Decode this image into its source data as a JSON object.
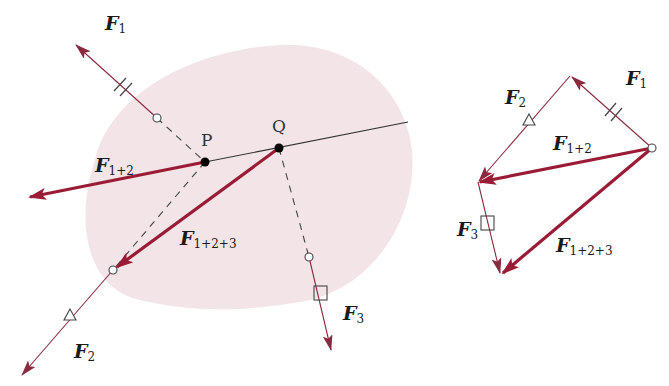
{
  "figure": {
    "colors": {
      "background": "#ffffff",
      "body_fill": "#f3e4e8",
      "resultant_arrow": "#9a1b35",
      "component_arrow": "#8a2a3e",
      "thin_line": "#6a4a52",
      "action_line": "#333333",
      "dashed_line": "#444444",
      "point": "#000000"
    },
    "points": {
      "P": {
        "label": "P",
        "x": 205,
        "y": 162
      },
      "Q": {
        "label": "Q",
        "x": 279,
        "y": 148
      }
    },
    "left_diagram": {
      "forces": [
        {
          "id": "F1",
          "symbol": "F",
          "subscript": "1",
          "kind": "component",
          "marker": "double-tick",
          "from": [
            157,
            118
          ],
          "to": [
            76,
            45
          ]
        },
        {
          "id": "F2",
          "symbol": "F",
          "subscript": "2",
          "kind": "component",
          "marker": "triangle",
          "from": [
            113,
            270
          ],
          "to": [
            22,
            375
          ]
        },
        {
          "id": "F3",
          "symbol": "F",
          "subscript": "3",
          "kind": "component",
          "marker": "square",
          "from": [
            309,
            257
          ],
          "to": [
            331,
            350
          ]
        },
        {
          "id": "F12",
          "symbol": "F",
          "subscript": "1+2",
          "kind": "resultant",
          "from": [
            205,
            162
          ],
          "to": [
            28,
            197
          ]
        },
        {
          "id": "F123",
          "symbol": "F",
          "subscript": "1+2+3",
          "kind": "resultant",
          "from": [
            279,
            148
          ],
          "to": [
            113,
            270
          ]
        }
      ]
    },
    "right_diagram": {
      "title": "force polygon",
      "vertices": {
        "origin": [
          652,
          148
        ],
        "a": [
          570,
          76
        ],
        "b": [
          478,
          182
        ],
        "c": [
          501,
          275
        ]
      },
      "forces": [
        {
          "id": "F1",
          "symbol": "F",
          "subscript": "1",
          "marker": "double-tick"
        },
        {
          "id": "F2",
          "symbol": "F",
          "subscript": "2",
          "marker": "triangle"
        },
        {
          "id": "F3",
          "symbol": "F",
          "subscript": "3",
          "marker": "square"
        },
        {
          "id": "F12",
          "symbol": "F",
          "subscript": "1+2"
        },
        {
          "id": "F123",
          "symbol": "F",
          "subscript": "1+2+3"
        }
      ]
    },
    "labels": {
      "F1_left": {
        "main": "F",
        "sub": "1"
      },
      "F2_left": {
        "main": "F",
        "sub": "2"
      },
      "F3_left": {
        "main": "F",
        "sub": "3"
      },
      "F12_left": {
        "main": "F",
        "sub": "1+2"
      },
      "F123_left": {
        "main": "F",
        "sub": "1+2+3"
      },
      "F1_right": {
        "main": "F",
        "sub": "1"
      },
      "F2_right": {
        "main": "F",
        "sub": "2"
      },
      "F3_right": {
        "main": "F",
        "sub": "3"
      },
      "F12_right": {
        "main": "F",
        "sub": "1+2"
      },
      "F123_right": {
        "main": "F",
        "sub": "1+2+3"
      },
      "P": "P",
      "Q": "Q"
    }
  }
}
